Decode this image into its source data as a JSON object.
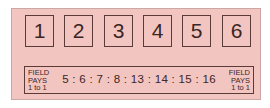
{
  "place_boxes": [
    {
      "label": "1"
    },
    {
      "label": "2"
    },
    {
      "label": "3"
    },
    {
      "label": "4"
    },
    {
      "label": "5"
    },
    {
      "label": "6"
    }
  ],
  "field_bet": {
    "left_label": {
      "line1": "FIELD",
      "line2": "PAYS",
      "line3": "1 to 1"
    },
    "right_label": {
      "line1": "FIELD",
      "line2": "PAYS",
      "line3": "1 to 1"
    },
    "numbers_text": "5 : 6 : 7 : 8 : 13 : 14 : 15 : 16",
    "numbers": [
      5,
      6,
      7,
      8,
      13,
      14,
      15,
      16
    ]
  },
  "colors": {
    "panel_bg": "#f3c5c1",
    "border": "#5a3b38",
    "text": "#3a2624"
  }
}
